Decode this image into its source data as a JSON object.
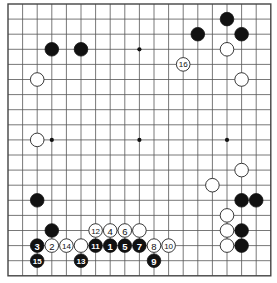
{
  "board": {
    "size": 19,
    "origin_x": 8,
    "origin_y": 4,
    "spacing_x": 14.6,
    "spacing_y": 15.1,
    "stone_radius": 6.8,
    "colors": {
      "black": "#111111",
      "white": "#ffffff",
      "line": "#555555"
    },
    "star_points": [
      [
        3,
        3
      ],
      [
        9,
        3
      ],
      [
        15,
        3
      ],
      [
        3,
        9
      ],
      [
        9,
        9
      ],
      [
        15,
        9
      ],
      [
        3,
        15
      ],
      [
        9,
        15
      ],
      [
        15,
        15
      ]
    ]
  },
  "stones": [
    {
      "color": "black",
      "col": 3,
      "row": 3
    },
    {
      "color": "black",
      "col": 5,
      "row": 3
    },
    {
      "color": "black",
      "col": 13,
      "row": 2
    },
    {
      "color": "black",
      "col": 15,
      "row": 1
    },
    {
      "color": "black",
      "col": 16,
      "row": 2
    },
    {
      "color": "black",
      "col": 2,
      "row": 13
    },
    {
      "color": "black",
      "col": 3,
      "row": 15
    },
    {
      "color": "black",
      "col": 16,
      "row": 13
    },
    {
      "color": "black",
      "col": 17,
      "row": 13
    },
    {
      "color": "black",
      "col": 16,
      "row": 15
    },
    {
      "color": "black",
      "col": 16,
      "row": 16
    },
    {
      "color": "white",
      "col": 2,
      "row": 5
    },
    {
      "color": "white",
      "col": 2,
      "row": 9
    },
    {
      "color": "white",
      "col": 15,
      "row": 3
    },
    {
      "color": "white",
      "col": 16,
      "row": 5
    },
    {
      "color": "white",
      "col": 16,
      "row": 11
    },
    {
      "color": "white",
      "col": 14,
      "row": 12
    },
    {
      "color": "white",
      "col": 15,
      "row": 14
    },
    {
      "color": "white",
      "col": 15,
      "row": 15
    },
    {
      "color": "white",
      "col": 15,
      "row": 16
    },
    {
      "color": "white",
      "col": 9,
      "row": 15
    },
    {
      "color": "white",
      "col": 5,
      "row": 16
    }
  ],
  "moves": [
    {
      "number": "1",
      "color": "black",
      "col": 7,
      "row": 16
    },
    {
      "number": "2",
      "color": "white",
      "col": 3,
      "row": 16
    },
    {
      "number": "3",
      "color": "black",
      "col": 2,
      "row": 16
    },
    {
      "number": "4",
      "color": "white",
      "col": 7,
      "row": 15
    },
    {
      "number": "5",
      "color": "black",
      "col": 8,
      "row": 16
    },
    {
      "number": "6",
      "color": "white",
      "col": 8,
      "row": 15
    },
    {
      "number": "7",
      "color": "black",
      "col": 9,
      "row": 16
    },
    {
      "number": "8",
      "color": "white",
      "col": 10,
      "row": 16
    },
    {
      "number": "9",
      "color": "black",
      "col": 10,
      "row": 17
    },
    {
      "number": "10",
      "color": "white",
      "col": 11,
      "row": 16
    },
    {
      "number": "11",
      "color": "black",
      "col": 6,
      "row": 16
    },
    {
      "number": "12",
      "color": "white",
      "col": 6,
      "row": 15
    },
    {
      "number": "13",
      "color": "black",
      "col": 5,
      "row": 17
    },
    {
      "number": "14",
      "color": "white",
      "col": 4,
      "row": 16
    },
    {
      "number": "15",
      "color": "black",
      "col": 2,
      "row": 17
    },
    {
      "number": "16",
      "color": "white",
      "col": 12,
      "row": 4
    }
  ]
}
